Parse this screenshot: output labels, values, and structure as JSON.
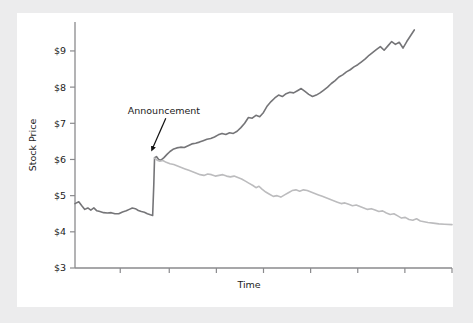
{
  "figure": {
    "background_color": "#ececed",
    "panel_color": "#ffffff"
  },
  "chart_data": {
    "type": "line",
    "title": "",
    "xlabel": "Time",
    "ylabel": "Stock Price",
    "ylim": [
      3,
      9.8
    ],
    "xlim": [
      0,
      100
    ],
    "grid": false,
    "legend_position": "none",
    "ytick_labels": [
      "$3",
      "$4",
      "$5",
      "$6",
      "$7",
      "$8",
      "$9"
    ],
    "ytick_values": [
      3,
      4,
      5,
      6,
      7,
      8,
      9
    ],
    "xtick_labels": [
      "",
      "",
      "",
      "",
      "",
      "",
      "",
      ""
    ],
    "xtick_values": [
      12,
      25,
      37.5,
      50,
      62.5,
      75,
      87.5,
      100
    ],
    "annotations": [
      {
        "label": "Announcement",
        "text_x": 14,
        "text_y": 7.25,
        "arrow_to_x": 20.8,
        "arrow_to_y": 6.1,
        "color": "#111111"
      }
    ],
    "series": [
      {
        "name": "post-announcement-rise",
        "color": "#757578",
        "width": 1.6,
        "points": [
          [
            0.0,
            4.78
          ],
          [
            1.0,
            4.83
          ],
          [
            1.8,
            4.72
          ],
          [
            2.6,
            4.62
          ],
          [
            3.4,
            4.66
          ],
          [
            4.2,
            4.6
          ],
          [
            5.0,
            4.66
          ],
          [
            5.8,
            4.58
          ],
          [
            6.6,
            4.56
          ],
          [
            7.6,
            4.53
          ],
          [
            8.6,
            4.52
          ],
          [
            9.6,
            4.53
          ],
          [
            10.6,
            4.5
          ],
          [
            11.6,
            4.5
          ],
          [
            12.6,
            4.55
          ],
          [
            13.6,
            4.58
          ],
          [
            14.4,
            4.62
          ],
          [
            15.2,
            4.66
          ],
          [
            16.0,
            4.64
          ],
          [
            16.8,
            4.59
          ],
          [
            17.6,
            4.56
          ],
          [
            18.4,
            4.54
          ],
          [
            19.2,
            4.5
          ],
          [
            20.0,
            4.47
          ],
          [
            20.6,
            4.45
          ],
          [
            20.9,
            5.3
          ],
          [
            21.1,
            6.05
          ],
          [
            21.6,
            6.08
          ],
          [
            22.2,
            6.0
          ],
          [
            22.8,
            5.98
          ],
          [
            23.6,
            6.05
          ],
          [
            24.4,
            6.14
          ],
          [
            25.2,
            6.22
          ],
          [
            26.0,
            6.28
          ],
          [
            27.0,
            6.32
          ],
          [
            28.0,
            6.34
          ],
          [
            29.0,
            6.33
          ],
          [
            30.0,
            6.38
          ],
          [
            31.0,
            6.43
          ],
          [
            32.0,
            6.45
          ],
          [
            33.0,
            6.48
          ],
          [
            34.0,
            6.52
          ],
          [
            35.0,
            6.56
          ],
          [
            36.0,
            6.58
          ],
          [
            37.0,
            6.62
          ],
          [
            38.0,
            6.68
          ],
          [
            39.0,
            6.72
          ],
          [
            40.0,
            6.69
          ],
          [
            41.0,
            6.74
          ],
          [
            42.0,
            6.72
          ],
          [
            43.0,
            6.78
          ],
          [
            44.0,
            6.88
          ],
          [
            45.0,
            7.0
          ],
          [
            46.0,
            7.16
          ],
          [
            47.0,
            7.14
          ],
          [
            48.0,
            7.22
          ],
          [
            49.0,
            7.18
          ],
          [
            50.0,
            7.3
          ],
          [
            51.0,
            7.48
          ],
          [
            52.0,
            7.6
          ],
          [
            53.0,
            7.7
          ],
          [
            54.0,
            7.78
          ],
          [
            55.0,
            7.74
          ],
          [
            56.0,
            7.82
          ],
          [
            57.0,
            7.86
          ],
          [
            58.0,
            7.84
          ],
          [
            59.0,
            7.9
          ],
          [
            60.0,
            7.96
          ],
          [
            61.0,
            7.88
          ],
          [
            62.0,
            7.8
          ],
          [
            63.0,
            7.74
          ],
          [
            64.0,
            7.78
          ],
          [
            65.0,
            7.84
          ],
          [
            66.0,
            7.92
          ],
          [
            67.0,
            8.0
          ],
          [
            68.0,
            8.1
          ],
          [
            69.0,
            8.18
          ],
          [
            70.0,
            8.28
          ],
          [
            71.0,
            8.34
          ],
          [
            72.0,
            8.42
          ],
          [
            73.0,
            8.48
          ],
          [
            74.0,
            8.56
          ],
          [
            75.0,
            8.62
          ],
          [
            76.0,
            8.7
          ],
          [
            77.0,
            8.78
          ],
          [
            78.0,
            8.88
          ],
          [
            79.0,
            8.96
          ],
          [
            80.0,
            9.04
          ],
          [
            81.0,
            9.12
          ],
          [
            82.0,
            9.02
          ],
          [
            83.0,
            9.14
          ],
          [
            84.0,
            9.26
          ],
          [
            85.0,
            9.18
          ],
          [
            86.0,
            9.24
          ],
          [
            87.0,
            9.08
          ],
          [
            88.0,
            9.26
          ],
          [
            89.0,
            9.42
          ],
          [
            90.0,
            9.58
          ]
        ]
      },
      {
        "name": "post-announcement-decline",
        "color": "#bcbcbe",
        "width": 1.6,
        "points": [
          [
            21.1,
            6.04
          ],
          [
            21.8,
            5.98
          ],
          [
            22.5,
            5.95
          ],
          [
            23.3,
            5.97
          ],
          [
            24.2,
            5.92
          ],
          [
            25.2,
            5.88
          ],
          [
            26.2,
            5.86
          ],
          [
            27.2,
            5.82
          ],
          [
            28.2,
            5.78
          ],
          [
            29.2,
            5.74
          ],
          [
            30.2,
            5.7
          ],
          [
            31.2,
            5.66
          ],
          [
            32.2,
            5.62
          ],
          [
            33.2,
            5.58
          ],
          [
            34.2,
            5.56
          ],
          [
            35.2,
            5.6
          ],
          [
            36.2,
            5.58
          ],
          [
            37.2,
            5.54
          ],
          [
            38.2,
            5.56
          ],
          [
            39.2,
            5.58
          ],
          [
            40.2,
            5.54
          ],
          [
            41.2,
            5.52
          ],
          [
            42.2,
            5.54
          ],
          [
            43.2,
            5.5
          ],
          [
            44.2,
            5.46
          ],
          [
            45.2,
            5.4
          ],
          [
            46.2,
            5.34
          ],
          [
            47.2,
            5.28
          ],
          [
            48.0,
            5.22
          ],
          [
            48.8,
            5.26
          ],
          [
            49.6,
            5.18
          ],
          [
            50.6,
            5.1
          ],
          [
            51.6,
            5.04
          ],
          [
            52.6,
            4.98
          ],
          [
            53.6,
            5.0
          ],
          [
            54.6,
            4.96
          ],
          [
            55.6,
            5.02
          ],
          [
            56.6,
            5.08
          ],
          [
            57.6,
            5.14
          ],
          [
            58.6,
            5.16
          ],
          [
            59.6,
            5.12
          ],
          [
            60.6,
            5.16
          ],
          [
            61.6,
            5.14
          ],
          [
            62.6,
            5.1
          ],
          [
            63.6,
            5.06
          ],
          [
            64.6,
            5.02
          ],
          [
            65.6,
            4.98
          ],
          [
            66.6,
            4.94
          ],
          [
            67.6,
            4.9
          ],
          [
            68.6,
            4.86
          ],
          [
            69.6,
            4.82
          ],
          [
            70.6,
            4.78
          ],
          [
            71.6,
            4.8
          ],
          [
            72.6,
            4.76
          ],
          [
            73.6,
            4.72
          ],
          [
            74.6,
            4.74
          ],
          [
            75.6,
            4.7
          ],
          [
            76.6,
            4.66
          ],
          [
            77.6,
            4.62
          ],
          [
            78.6,
            4.64
          ],
          [
            79.6,
            4.6
          ],
          [
            80.6,
            4.56
          ],
          [
            81.6,
            4.58
          ],
          [
            82.6,
            4.52
          ],
          [
            83.6,
            4.48
          ],
          [
            84.6,
            4.5
          ],
          [
            85.6,
            4.44
          ],
          [
            86.6,
            4.38
          ],
          [
            87.6,
            4.4
          ],
          [
            88.6,
            4.34
          ],
          [
            89.6,
            4.32
          ],
          [
            90.6,
            4.36
          ],
          [
            91.6,
            4.3
          ],
          [
            92.6,
            4.28
          ],
          [
            93.6,
            4.26
          ],
          [
            95.0,
            4.24
          ],
          [
            96.5,
            4.22
          ],
          [
            98.0,
            4.21
          ],
          [
            100.0,
            4.2
          ]
        ]
      }
    ]
  }
}
